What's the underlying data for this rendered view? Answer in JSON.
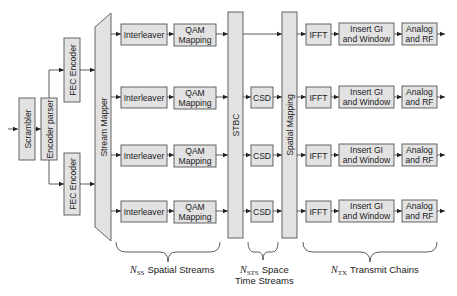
{
  "diagram": {
    "type": "block-diagram",
    "title": "",
    "blocks": {
      "scrambler": "Scrambler",
      "encoder_parser": "Encoder parser",
      "fec_encoder": "FEC Encoder",
      "stream_mapper": "Stream Mapper",
      "interleaver": "Interleaver",
      "qam_line1": "QAM",
      "qam_line2": "Mapping",
      "stbc": "STBC",
      "csd": "CSD",
      "spatial_mapping": "Spatial Mapping",
      "ifft": "IFFT",
      "insert_gi_line1": "Insert GI",
      "insert_gi_line2": "and Window",
      "analog_line1": "Analog",
      "analog_line2": "and RF"
    },
    "braces": {
      "spatial": {
        "symbol": "N",
        "subscript": "SS",
        "label": "Spatial Streams"
      },
      "space_time": {
        "symbol": "N",
        "subscript": "STS",
        "label_line1": "Space",
        "label_line2": "Time Streams"
      },
      "transmit": {
        "symbol": "N",
        "subscript": "TX",
        "label": "Transmit Chains"
      }
    },
    "rows": 4,
    "colors": {
      "block_fill": "#e2e2e2",
      "block_stroke": "#555555",
      "line": "#333333"
    }
  }
}
